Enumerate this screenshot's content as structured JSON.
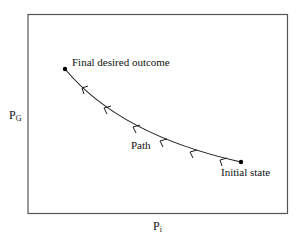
{
  "diagram": {
    "y_axis": {
      "main": "P",
      "sub": "G"
    },
    "x_axis": {
      "main": "P",
      "sub": "i"
    },
    "labels": {
      "final": "Final desired outcome",
      "path": "Path",
      "initial": "Initial state"
    },
    "colors": {
      "line": "#1a1a1a",
      "frame": "#555555"
    }
  }
}
